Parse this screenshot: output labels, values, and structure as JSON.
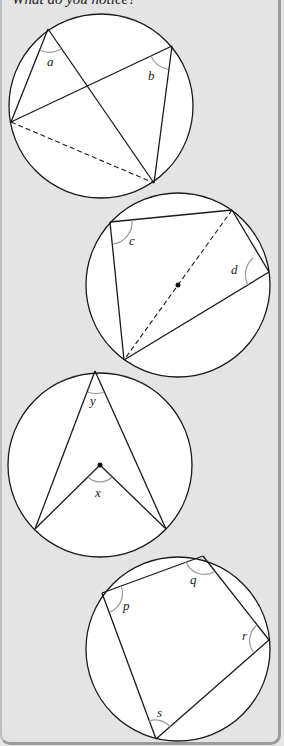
{
  "prompt": "What do you notice?",
  "colors": {
    "background": "#e4e4e4",
    "circle_fill": "#ffffff",
    "stroke": "#1a1a1a",
    "angle_arc": "#9a9a9a",
    "border": "#9a9a9a"
  },
  "figures": [
    {
      "id": "circle-1",
      "description": "Two inscribed angles subtending the same arc (dashed chord)",
      "angles": [
        {
          "label": "a"
        },
        {
          "label": "b"
        }
      ]
    },
    {
      "id": "circle-2",
      "description": "Cyclic quadrilateral with diameter drawn through the centre",
      "angles": [
        {
          "label": "c"
        },
        {
          "label": "d"
        }
      ]
    },
    {
      "id": "circle-3",
      "description": "Angle at centre and angle at circumference subtending the same arc",
      "angles": [
        {
          "label": "y"
        },
        {
          "label": "x"
        }
      ]
    },
    {
      "id": "circle-4",
      "description": "Cyclic quadrilateral",
      "angles": [
        {
          "label": "p"
        },
        {
          "label": "q"
        },
        {
          "label": "r"
        },
        {
          "label": "s"
        }
      ]
    }
  ]
}
